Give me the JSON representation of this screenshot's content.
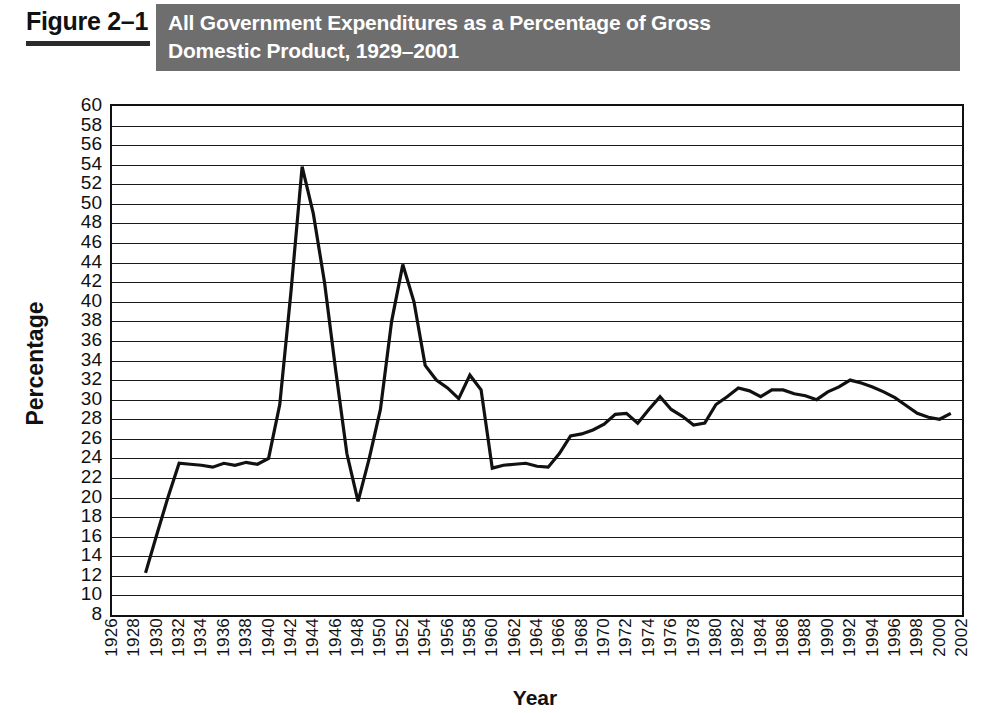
{
  "figure": {
    "label": "Figure 2–1",
    "title_line1": "All Government Expenditures as a Percentage of Gross",
    "title_line2": "Domestic Product, 1929–2001",
    "header_bg": "#6e6e6e",
    "header_text_color": "#ffffff"
  },
  "chart_data": {
    "type": "line",
    "title": "All Government Expenditures as a Percentage of Gross Domestic Product, 1929–2001",
    "xlabel": "Year",
    "ylabel": "Percentage",
    "xlim": [
      1926,
      2002
    ],
    "ylim": [
      8,
      60
    ],
    "ytick_step": 2,
    "xtick_step": 2,
    "grid": "horizontal",
    "legend": "none",
    "line_color": "#111111",
    "line_width": 3.2,
    "yticks": [
      8,
      10,
      12,
      14,
      16,
      18,
      20,
      22,
      24,
      26,
      28,
      30,
      32,
      34,
      36,
      38,
      40,
      42,
      44,
      46,
      48,
      50,
      52,
      54,
      56,
      58,
      60
    ],
    "xticks": [
      1926,
      1928,
      1930,
      1932,
      1934,
      1936,
      1938,
      1940,
      1942,
      1944,
      1946,
      1948,
      1950,
      1952,
      1954,
      1956,
      1958,
      1960,
      1962,
      1964,
      1966,
      1968,
      1970,
      1972,
      1974,
      1976,
      1978,
      1980,
      1982,
      1984,
      1986,
      1988,
      1990,
      1992,
      1994,
      1996,
      1998,
      2000,
      2002
    ],
    "x": [
      1929,
      1930,
      1931,
      1932,
      1933,
      1934,
      1935,
      1936,
      1937,
      1938,
      1939,
      1940,
      1941,
      1942,
      1943,
      1944,
      1945,
      1946,
      1947,
      1948,
      1949,
      1950,
      1951,
      1952,
      1953,
      1954,
      1955,
      1956,
      1957,
      1958,
      1959,
      1960,
      1961,
      1962,
      1963,
      1964,
      1965,
      1966,
      1967,
      1968,
      1969,
      1970,
      1971,
      1972,
      1973,
      1974,
      1975,
      1976,
      1977,
      1978,
      1979,
      1980,
      1981,
      1982,
      1983,
      1984,
      1985,
      1986,
      1987,
      1988,
      1989,
      1990,
      1991,
      1992,
      1993,
      1994,
      1995,
      1996,
      1997,
      1998,
      1999,
      2000,
      2001
    ],
    "y": [
      12.3,
      16.2,
      20.0,
      23.5,
      23.4,
      23.3,
      23.1,
      23.5,
      23.3,
      23.6,
      23.4,
      24.0,
      29.5,
      41.0,
      53.8,
      49.0,
      42.0,
      33.0,
      24.5,
      19.6,
      24.0,
      29.0,
      38.0,
      43.8,
      40.0,
      33.5,
      32.0,
      31.2,
      30.1,
      32.5,
      31.0,
      23.0,
      23.3,
      23.4,
      23.5,
      23.2,
      23.1,
      24.5,
      26.3,
      26.5,
      26.9,
      27.5,
      28.5,
      28.6,
      27.6,
      29.0,
      30.3,
      29.0,
      28.3,
      27.4,
      27.6,
      29.5,
      30.3,
      31.2,
      30.9,
      30.3,
      31.0,
      31.0,
      30.6,
      30.4,
      30.0,
      30.8,
      31.3,
      32.0,
      31.7,
      31.3,
      30.8,
      30.2,
      29.4,
      28.6,
      28.2,
      28.0,
      28.6
    ]
  }
}
